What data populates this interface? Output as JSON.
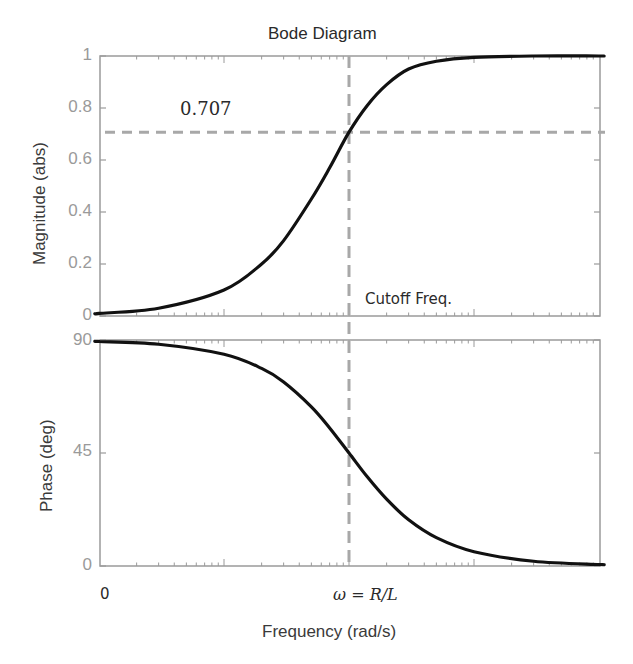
{
  "chart_data": [
    {
      "type": "line",
      "panel": "magnitude",
      "title": "Bode Diagram",
      "xlabel": "Frequency  (rad/s)",
      "ylabel": "Magnitude (abs)",
      "xscale": "log",
      "x_decades_relative_to_cutoff": [
        -2,
        -1,
        0,
        1,
        2
      ],
      "ylim": [
        0,
        1
      ],
      "yticks": [
        "0",
        "0.2",
        "0.4",
        "0.6",
        "0.8",
        "1"
      ],
      "series": [
        {
          "name": "magnitude",
          "x_rel_cutoff": [
            0.01,
            0.03,
            0.1,
            0.2,
            0.3,
            0.5,
            0.7,
            1.0,
            1.4,
            2,
            3,
            5,
            10,
            30,
            100
          ],
          "values": [
            0.01,
            0.03,
            0.1,
            0.2,
            0.29,
            0.45,
            0.57,
            0.707,
            0.81,
            0.89,
            0.95,
            0.98,
            0.995,
            1.0,
            1.0
          ]
        }
      ],
      "reference_lines": [
        {
          "orientation": "horizontal",
          "value": 0.707,
          "style": "dashed",
          "label": "0.707"
        },
        {
          "orientation": "vertical",
          "value": "ω = R/L",
          "style": "dashed",
          "label": "Cutoff Freq."
        }
      ],
      "grid": false
    },
    {
      "type": "line",
      "panel": "phase",
      "ylabel": "Phase (deg)",
      "xscale": "log",
      "ylim": [
        0,
        90
      ],
      "yticks": [
        "0",
        "45",
        "90"
      ],
      "xtick_labels": [
        "0",
        "ω = R/L"
      ],
      "series": [
        {
          "name": "phase",
          "x_rel_cutoff": [
            0.01,
            0.03,
            0.1,
            0.2,
            0.3,
            0.5,
            0.7,
            1.0,
            1.4,
            2,
            3,
            5,
            10,
            30,
            100
          ],
          "values": [
            89.4,
            88.3,
            84.3,
            78.7,
            73.3,
            63.4,
            55.0,
            45.0,
            35.5,
            26.6,
            18.4,
            11.3,
            5.7,
            1.9,
            0.6
          ]
        }
      ],
      "grid": false
    }
  ],
  "labels": {
    "title": "Bode Diagram",
    "mag_ylabel": "Magnitude (abs)",
    "phase_ylabel": "Phase (deg)",
    "xlabel": "Frequency  (rad/s)",
    "annotation_level": "0.707",
    "annotation_cutoff": "Cutoff Freq.",
    "xtick_zero": "0",
    "xtick_cutoff": "ω = R/L",
    "mag_yticks": [
      "1",
      "0.8",
      "0.6",
      "0.4",
      "0.2",
      "0"
    ],
    "phase_yticks": [
      "90",
      "45",
      "0"
    ]
  },
  "colors": {
    "curve": "#111111",
    "dashed": "#a8a8a8",
    "axis": "#9a9a9a",
    "tick_label": "#9a9a9a"
  }
}
